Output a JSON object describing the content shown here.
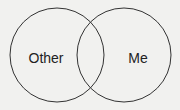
{
  "diagram": {
    "type": "venn",
    "sets": [
      {
        "label": "Other",
        "cx": 57,
        "cy": 55,
        "r": 47
      },
      {
        "label": "Me",
        "cx": 124,
        "cy": 55,
        "r": 47
      }
    ],
    "stroke_color": "#333333",
    "background": "#f1f1ef"
  }
}
